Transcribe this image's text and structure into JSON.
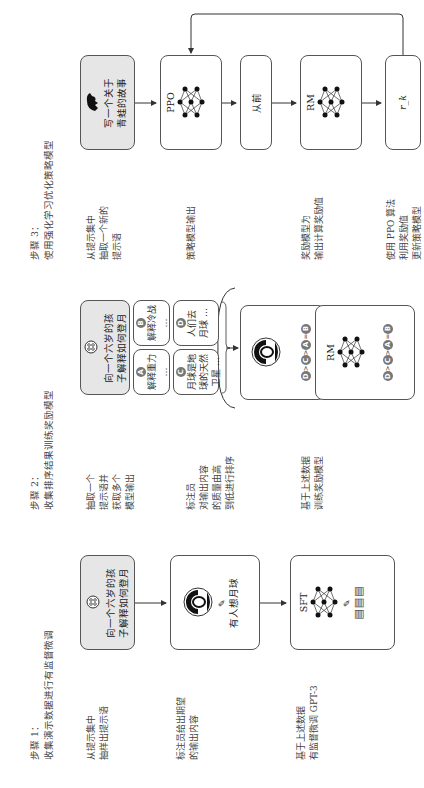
{
  "step1": {
    "title_line1": "步骤 1：",
    "title_line2": "收集演示数据进行有监督微调",
    "desc1": [
      "从提示集中",
      "抽样出提示语"
    ],
    "prompt_box": [
      "向一个六岁的孩",
      "子解释如何登月"
    ],
    "desc2": [
      "标注员给出期望",
      "的输出内容"
    ],
    "labeler_output": "有人想月球",
    "desc3": [
      "基于上述数据",
      "有监督微调 GPT-3"
    ],
    "model_label": "SFT"
  },
  "step2": {
    "title_line1": "步骤 2：",
    "title_line2": "收集排序结果训练奖励模型",
    "desc1": [
      "抽取一个",
      "提示语并",
      "获取多个",
      "模型输出"
    ],
    "prompt_box": [
      "向一个六岁的孩",
      "子解释如何登月"
    ],
    "options": [
      {
        "letter": "A",
        "text": [
          "解释重力",
          "…"
        ]
      },
      {
        "letter": "B",
        "text": [
          "解释冷战",
          "…"
        ]
      },
      {
        "letter": "C",
        "text": [
          "月球是地",
          "球的天然",
          "卫星 …"
        ]
      },
      {
        "letter": "D",
        "text": [
          "人们去",
          "月球 …"
        ]
      }
    ],
    "desc2": [
      "标注员",
      "对输出内容",
      "的质量由高",
      "到低进行排序"
    ],
    "ranking": [
      "D",
      ">",
      "C",
      ">",
      "A",
      "=",
      "B"
    ],
    "desc3": [
      "基于上述数据",
      "训练奖励模型"
    ],
    "model_label": "RM"
  },
  "step3": {
    "title_line1": "步骤 3：",
    "title_line2": "使用强化学习优化策略模型",
    "desc1": [
      "从提示集中",
      "抽取一个新的",
      "提示语"
    ],
    "prompt_box": [
      "写一个关于",
      "青蛙的故事"
    ],
    "policy_label": "PPO",
    "desc2": [
      "策略模型输出"
    ],
    "output_text": "从前",
    "reward_label": "RM",
    "desc3": [
      "奖励模型为",
      "输出计算奖励值"
    ],
    "reward_value": "r_k",
    "desc4": [
      "使用 PPO 算法",
      "利用奖励值",
      "更新策略模型"
    ]
  }
}
